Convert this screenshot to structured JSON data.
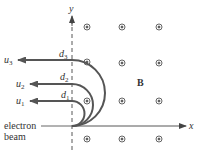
{
  "diagram": {
    "axes": {
      "x_label": "x",
      "y_label": "y"
    },
    "field_label": "B",
    "beam_label_line1": "electron",
    "beam_label_line2": "beam",
    "trajectories": [
      {
        "speed_label": "u",
        "speed_sub": "1",
        "distance_label": "d",
        "distance_sub": "1"
      },
      {
        "speed_label": "u",
        "speed_sub": "2",
        "distance_label": "d",
        "distance_sub": "2"
      },
      {
        "speed_label": "u",
        "speed_sub": "3",
        "distance_label": "d",
        "distance_sub": "3"
      }
    ],
    "field_symbol": "dot-out-of-page",
    "colors": {
      "curve": "#555555",
      "axis": "#444444",
      "text": "#333333",
      "background": "#ffffff"
    }
  }
}
